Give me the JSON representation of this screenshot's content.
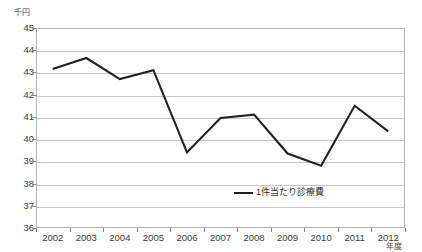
{
  "chart_data": {
    "type": "line",
    "title": "",
    "subtitle": "",
    "unit_label": "千円",
    "xlabel": "年度",
    "ylabel": "",
    "categories": [
      "2002",
      "2003",
      "2004",
      "2005",
      "2006",
      "2007",
      "2008",
      "2009",
      "2010",
      "2011",
      "2012"
    ],
    "series": [
      {
        "name": "1件当たり診療費",
        "color": "#222222",
        "values": [
          43.15,
          43.65,
          42.7,
          43.1,
          39.4,
          40.95,
          41.1,
          39.35,
          38.8,
          41.5,
          40.35
        ]
      }
    ],
    "ylim": [
      36,
      45
    ],
    "ytick_labels": [
      "45",
      "44",
      "43",
      "42",
      "41",
      "40",
      "39",
      "38",
      "37",
      "36"
    ],
    "ytick_values": [
      45,
      44,
      43,
      42,
      41,
      40,
      39,
      38,
      37,
      36
    ],
    "grid": true,
    "legend_position": "inside-bottom-center",
    "legend_entries": [
      "1件当たり診療費"
    ]
  }
}
